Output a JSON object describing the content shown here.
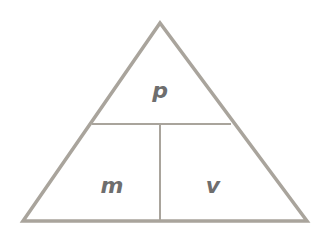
{
  "diagram": {
    "type": "formula-triangle",
    "colors": {
      "line": "#a9a49c",
      "label": "#6e6e6e",
      "background": "#ffffff"
    },
    "cells": {
      "top": {
        "label": "p"
      },
      "bottom_left": {
        "label": "m"
      },
      "bottom_right": {
        "label": "v"
      }
    }
  }
}
